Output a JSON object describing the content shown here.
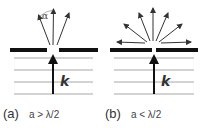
{
  "figure": {
    "panels": [
      {
        "id": "a",
        "tag": "(a)",
        "condition": "a > λ/2",
        "wavevector_label": "k",
        "angle_label": "α",
        "emitted_rays": 3,
        "description": "aperture larger than half wavelength: few diffracted directions within angle alpha"
      },
      {
        "id": "b",
        "tag": "(b)",
        "condition": "a < λ/2",
        "wavevector_label": "k",
        "emitted_rays": 7,
        "description": "aperture smaller than half wavelength: rays spread in all directions"
      }
    ],
    "colors": {
      "screen": "#111111",
      "wavefront_lines": "#bdbdbd",
      "arrows": "#333333",
      "k_arrow": "#111111",
      "text": "#333333"
    }
  }
}
